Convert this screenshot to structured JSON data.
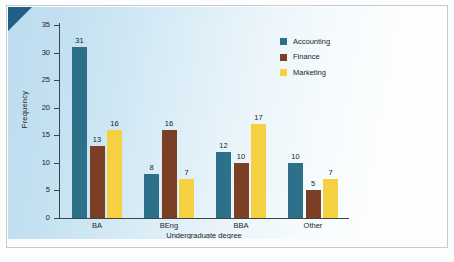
{
  "chart_data": {
    "type": "bar",
    "title": "",
    "subtitle": "",
    "xlabel": "Undergraduate degree",
    "ylabel": "Frequency",
    "categories": [
      "BA",
      "BEng",
      "BBA",
      "Other"
    ],
    "series": [
      {
        "name": "Accounting",
        "color": "#2d7089",
        "values": [
          31,
          8,
          12,
          10
        ]
      },
      {
        "name": "Finance",
        "color": "#7b3f25",
        "values": [
          13,
          16,
          10,
          5
        ]
      },
      {
        "name": "Marketing",
        "color": "#f5d142",
        "values": [
          16,
          7,
          17,
          7
        ]
      }
    ],
    "ylim": [
      0,
      35
    ],
    "yticks": [
      0,
      5,
      10,
      15,
      20,
      25,
      30,
      35
    ],
    "ytick_labels": [
      "0",
      "5",
      "10",
      "15",
      "20",
      "25",
      "30",
      "35"
    ],
    "grid": false,
    "legend_position": "top-right",
    "data_labels": true,
    "bar_labels": {
      "BA": {
        "Accounting": "31",
        "Finance": "13",
        "Marketing": "16"
      },
      "BEng": {
        "Accounting": "8",
        "Finance": "16",
        "Marketing": "7"
      },
      "BBA": {
        "Accounting": "12",
        "Finance": "10",
        "Marketing": "17"
      },
      "Other": {
        "Accounting": "10",
        "Finance": "5",
        "Marketing": "7"
      }
    }
  },
  "axes": {
    "y_title": "Frequency",
    "x_title": "Undergraduate degree",
    "y_labels": [
      "0",
      "5",
      "10",
      "15",
      "20",
      "25",
      "30",
      "35"
    ],
    "x_labels": [
      "BA",
      "BEng",
      "BBA",
      "Other"
    ]
  },
  "legend": {
    "items": [
      {
        "label": "Accounting",
        "color": "#2d7089"
      },
      {
        "label": "Finance",
        "color": "#7b3f25"
      },
      {
        "label": "Marketing",
        "color": "#f5d142"
      }
    ]
  },
  "theme": {
    "panel_start": "#bcdcef",
    "panel_end": "#ffffff",
    "corner_fold": "#1d5f86",
    "axis": "#3f4346",
    "text": "#1b1d1f",
    "frame_rule": "#c3ccd4"
  }
}
